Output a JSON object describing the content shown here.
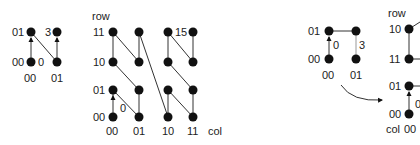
{
  "panel1": {
    "row_labels": [
      "01",
      "00"
    ],
    "col_labels": [
      "00",
      "01"
    ],
    "start_label": "0",
    "end_label": "3"
  },
  "panel2": {
    "axis_row": "row",
    "axis_col": "col",
    "row_labels": [
      "11",
      "10",
      "01",
      "00"
    ],
    "col_labels": [
      "00",
      "01",
      "10",
      "11"
    ],
    "start_label": "0",
    "end_label": "15"
  },
  "panel3": {
    "row_labels": [
      "01",
      "00"
    ],
    "col_labels": [
      "00",
      "01"
    ],
    "start_label": "0",
    "end_label": "3"
  },
  "panel4": {
    "axis_row": "row",
    "axis_col": "col",
    "row_labels": [
      "10",
      "11",
      "01",
      "00"
    ],
    "col_labels": [
      "00"
    ],
    "start_label": "0"
  },
  "colors": {
    "ink": "#111111",
    "line": "#333333"
  }
}
